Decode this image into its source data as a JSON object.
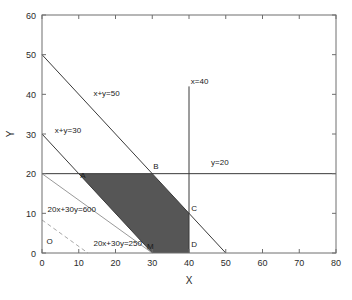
{
  "chart_data": {
    "type": "line",
    "title": "",
    "xlabel": "X",
    "ylabel": "Y",
    "xlim": [
      0,
      80
    ],
    "ylim": [
      0,
      60
    ],
    "xticks": [
      0,
      10,
      20,
      30,
      40,
      50,
      60,
      70,
      80
    ],
    "yticks": [
      0,
      10,
      20,
      30,
      40,
      50,
      60
    ],
    "xtick_labels": [
      "0",
      "10",
      "20",
      "30",
      "40",
      "50",
      "60",
      "70",
      "80"
    ],
    "ytick_labels": [
      "0",
      "10",
      "20",
      "30",
      "40",
      "50",
      "60"
    ],
    "grid": false,
    "legend": "none",
    "series": [
      {
        "name": "x+y=50",
        "style": "solid",
        "color": "#3a3a3a",
        "points": [
          [
            0,
            50
          ],
          [
            50,
            0
          ]
        ]
      },
      {
        "name": "x+y=30",
        "style": "solid",
        "color": "#3a3a3a",
        "points": [
          [
            0,
            30
          ],
          [
            30,
            0
          ]
        ]
      },
      {
        "name": "x=40",
        "style": "solid",
        "color": "#3a3a3a",
        "points": [
          [
            40,
            0
          ],
          [
            40,
            42
          ]
        ]
      },
      {
        "name": "y=20",
        "style": "solid",
        "color": "#3a3a3a",
        "points": [
          [
            0,
            20
          ],
          [
            80,
            20
          ]
        ]
      },
      {
        "name": "20x+30y=600",
        "style": "solid",
        "color": "#9a9a9a",
        "points": [
          [
            0,
            20
          ],
          [
            30,
            0
          ]
        ]
      },
      {
        "name": "20x+30y=250",
        "style": "dashed",
        "color": "#a8a8a8",
        "points": [
          [
            0,
            8.33
          ],
          [
            12.5,
            0
          ]
        ]
      }
    ],
    "shaded_region": {
      "name": "feasible-region",
      "fill": "#565656",
      "vertices": [
        [
          10,
          20
        ],
        [
          30,
          20
        ],
        [
          40,
          10
        ],
        [
          40,
          0
        ],
        [
          30,
          0
        ]
      ]
    },
    "annotations": [
      {
        "name": "line-label-xy50",
        "text": "x+y=50",
        "x": 14,
        "y": 39.5
      },
      {
        "name": "line-label-xy30",
        "text": "x+y=30",
        "x": 3.5,
        "y": 30.2
      },
      {
        "name": "line-label-x40",
        "text": "x=40",
        "x": 40.5,
        "y": 42.5
      },
      {
        "name": "line-label-y20",
        "text": "y=20",
        "x": 46,
        "y": 22.2
      },
      {
        "name": "line-label-600",
        "text": "20x+30y=600",
        "x": 1.5,
        "y": 10.3
      },
      {
        "name": "line-label-250",
        "text": "20x+30y=250",
        "x": 14,
        "y": 1.8
      }
    ],
    "point_labels": [
      {
        "name": "vertex-O",
        "text": "O",
        "x": 1.2,
        "y": 2.3
      },
      {
        "name": "vertex-A",
        "text": "A",
        "x": 10.4,
        "y": 19.0
      },
      {
        "name": "vertex-B",
        "text": "B",
        "x": 30.3,
        "y": 21.2
      },
      {
        "name": "vertex-C",
        "text": "C",
        "x": 40.6,
        "y": 10.6
      },
      {
        "name": "vertex-M",
        "text": "M",
        "x": 28.6,
        "y": 1.0
      },
      {
        "name": "vertex-D",
        "text": "D",
        "x": 40.6,
        "y": 1.6
      }
    ]
  }
}
